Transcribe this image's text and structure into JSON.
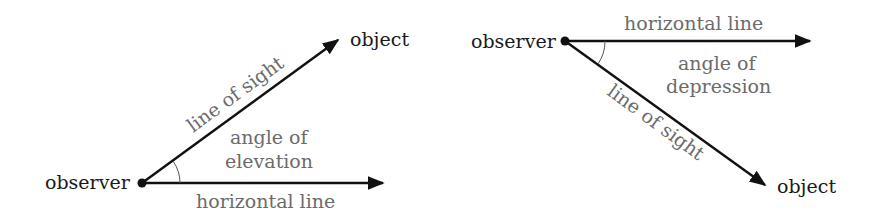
{
  "diagrams": {
    "elevation": {
      "observer_label": "observer",
      "object_label": "object",
      "sight_label": "line of sight",
      "angle_label_line1": "angle of",
      "angle_label_line2": "elevation",
      "horizontal_label": "horizontal line"
    },
    "depression": {
      "observer_label": "observer",
      "object_label": "object",
      "sight_label": "line of sight",
      "angle_label_line1": "angle of",
      "angle_label_line2": "depression",
      "horizontal_label": "horizontal line"
    }
  },
  "colors": {
    "line": "#111111",
    "dark_text": "#1a1a1a",
    "gray_text": "#6b6b6b",
    "background": "#ffffff"
  }
}
